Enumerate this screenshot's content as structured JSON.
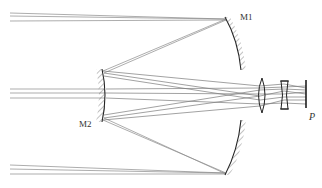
{
  "diagram": {
    "labels": {
      "mirror1": "M1",
      "mirror2": "M2",
      "image_plane": "P"
    },
    "components": [
      {
        "id": "mirror1",
        "type": "concave-mirror",
        "label": "M1"
      },
      {
        "id": "mirror1b",
        "type": "concave-mirror",
        "label": ""
      },
      {
        "id": "mirror2",
        "type": "convex-mirror",
        "label": "M2"
      },
      {
        "id": "lens1",
        "type": "biconvex-lens",
        "label": ""
      },
      {
        "id": "lens2",
        "type": "biconcave-lens",
        "label": ""
      },
      {
        "id": "image-plane",
        "type": "image-plane",
        "label": "P"
      }
    ],
    "ray_bundles": [
      "top-field",
      "on-axis",
      "bottom-field"
    ],
    "colors": {
      "ray": "#8a8a8a",
      "ray_dark": "#555555",
      "component": "#222222"
    }
  }
}
